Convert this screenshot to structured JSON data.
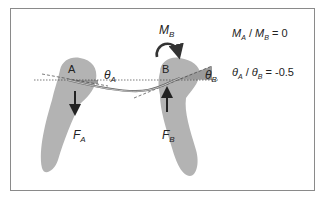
{
  "diagram": {
    "point_a_label": "A",
    "point_b_label": "B",
    "theta_a": {
      "main": "θ",
      "sub": "A"
    },
    "theta_b": {
      "main": "θ",
      "sub": "B"
    },
    "moment_b": {
      "main": "M",
      "sub": "B"
    },
    "force_a": {
      "main": "F",
      "sub": "A"
    },
    "force_b": {
      "main": "F",
      "sub": "B"
    },
    "force_a_direction": "down",
    "force_b_direction": "up",
    "moment_b_direction": "clockwise"
  },
  "equations": [
    {
      "lhs_num": {
        "main": "M",
        "sub": "A"
      },
      "sep": " / ",
      "lhs_den": {
        "main": "M",
        "sub": "B"
      },
      "rhs": " = 0"
    },
    {
      "lhs_num": {
        "main": "θ",
        "sub": "A"
      },
      "sep": " / ",
      "lhs_den": {
        "main": "θ",
        "sub": "B"
      },
      "rhs": " = -0.5"
    }
  ],
  "colors": {
    "tooth": "#b3b3b3",
    "frame": "#8a8a8a",
    "text": "#222222",
    "arrow": "#222222"
  }
}
